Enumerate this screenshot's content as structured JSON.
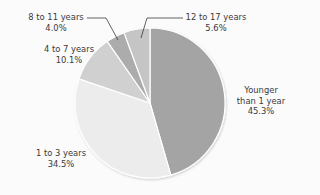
{
  "chart_data": {
    "type": "pie",
    "title": "",
    "start_angle_deg": 0,
    "direction": "clockwise",
    "center": [
      150,
      103
    ],
    "radius": 75,
    "slices": [
      {
        "label": "Younger than 1 year",
        "value": 45.3,
        "value_label": "45.3%",
        "color": "#a4a4a4"
      },
      {
        "label": "1 to 3 years",
        "value": 34.5,
        "value_label": "34.5%",
        "color": "#ececec"
      },
      {
        "label": "4 to 7 years",
        "value": 10.1,
        "value_label": "10.1%",
        "color": "#d0d0d0"
      },
      {
        "label": "8 to 11 years",
        "value": 4.0,
        "value_label": "4.0%",
        "color": "#acacac"
      },
      {
        "label": "12 to 17 years",
        "value": 5.6,
        "value_label": "5.6%",
        "color": "#c5c5c5"
      }
    ],
    "categories": [
      "Younger than 1 year",
      "1 to 3 years",
      "4 to 7 years",
      "8 to 11 years",
      "12 to 17 years"
    ],
    "values": [
      45.3,
      34.5,
      10.1,
      4.0,
      5.6
    ],
    "legend": "none (direct labels)"
  },
  "labels": {
    "younger": {
      "line1": "Younger",
      "line2": "than 1 year",
      "pct": "45.3%"
    },
    "one_three": {
      "line1": "1 to 3 years",
      "pct": "34.5%"
    },
    "four_seven": {
      "line1": "4 to 7 years",
      "pct": "10.1%"
    },
    "eight_eleven": {
      "line1": "8 to 11 years",
      "pct": "4.0%"
    },
    "twelve_seventeen": {
      "line1": "12 to 17 years",
      "pct": "5.6%"
    }
  },
  "colors": {
    "background": "#fbfbfb",
    "slice_border": "#ffffff",
    "leader_line": "#3a3a3a",
    "text": "#3a3a3a"
  }
}
